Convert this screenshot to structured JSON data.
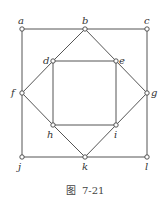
{
  "figure": {
    "caption": "图  7-21",
    "vertices": [
      {
        "id": "a",
        "x": 22,
        "y": 29,
        "lx": 18,
        "ly": 24
      },
      {
        "id": "b",
        "x": 85,
        "y": 29,
        "lx": 82,
        "ly": 24
      },
      {
        "id": "c",
        "x": 147,
        "y": 29,
        "lx": 144,
        "ly": 24
      },
      {
        "id": "d",
        "x": 53,
        "y": 61,
        "lx": 43,
        "ly": 64
      },
      {
        "id": "e",
        "x": 116,
        "y": 61,
        "lx": 119,
        "ly": 64
      },
      {
        "id": "f",
        "x": 22,
        "y": 93,
        "lx": 11,
        "ly": 96
      },
      {
        "id": "g",
        "x": 147,
        "y": 93,
        "lx": 151,
        "ly": 96
      },
      {
        "id": "h",
        "x": 53,
        "y": 125,
        "lx": 47,
        "ly": 138
      },
      {
        "id": "i",
        "x": 116,
        "y": 125,
        "lx": 114,
        "ly": 138
      },
      {
        "id": "j",
        "x": 22,
        "y": 157,
        "lx": 18,
        "ly": 170
      },
      {
        "id": "k",
        "x": 85,
        "y": 157,
        "lx": 82,
        "ly": 170
      },
      {
        "id": "l",
        "x": 147,
        "y": 157,
        "lx": 145,
        "ly": 170
      }
    ],
    "edges": [
      [
        "a",
        "b"
      ],
      [
        "b",
        "c"
      ],
      [
        "a",
        "f"
      ],
      [
        "f",
        "j"
      ],
      [
        "c",
        "g"
      ],
      [
        "g",
        "l"
      ],
      [
        "j",
        "k"
      ],
      [
        "k",
        "l"
      ],
      [
        "b",
        "d"
      ],
      [
        "b",
        "e"
      ],
      [
        "d",
        "f"
      ],
      [
        "e",
        "g"
      ],
      [
        "f",
        "h"
      ],
      [
        "g",
        "i"
      ],
      [
        "h",
        "k"
      ],
      [
        "i",
        "k"
      ],
      [
        "d",
        "e"
      ],
      [
        "d",
        "h"
      ],
      [
        "e",
        "i"
      ],
      [
        "h",
        "i"
      ]
    ]
  }
}
